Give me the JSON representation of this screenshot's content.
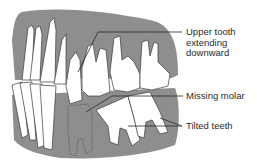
{
  "diagram": {
    "colors": {
      "gum": "#8e8e8e",
      "tooth": "#ffffff",
      "outline": "#3a3a3a",
      "text": "#2a2a2a"
    },
    "labels": [
      {
        "id": "upper-tooth",
        "lines": [
          "Upper tooth",
          "extending",
          "downward"
        ]
      },
      {
        "id": "missing-molar",
        "lines": [
          "Missing molar"
        ]
      },
      {
        "id": "tilted-teeth",
        "lines": [
          "Tilted teeth"
        ]
      }
    ]
  }
}
